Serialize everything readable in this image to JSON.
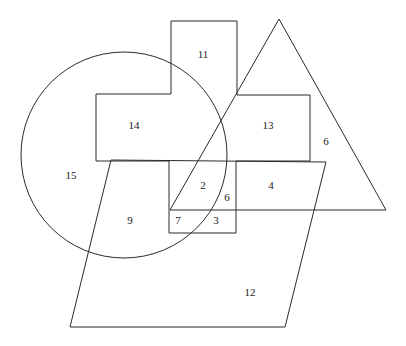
{
  "figure": {
    "canvas": {
      "width": 406,
      "height": 346,
      "background": "#ffffff"
    },
    "stroke_color": "#2b2b2b",
    "label_color": "#1a1a1a",
    "shapes": [
      {
        "name": "circle",
        "type": "circle",
        "cx": 124,
        "cy": 155,
        "r": 103
      },
      {
        "name": "cross-polygon",
        "type": "polygon",
        "points": "171,21 237,21 237,95 310,95 310,161 236,161 236,233 169,233 169,161 96,161 96,94 171,94"
      },
      {
        "name": "triangle",
        "type": "polygon",
        "points": "279,19 386,210 170,210"
      },
      {
        "name": "parallelogram",
        "type": "polygon",
        "points": "111,160 326,162 285,327 70,327"
      }
    ],
    "labels": [
      {
        "name": "region-label-11",
        "text": "11",
        "x": 203,
        "y": 55
      },
      {
        "name": "region-label-14",
        "text": "14",
        "x": 134,
        "y": 126
      },
      {
        "name": "region-label-13",
        "text": "13",
        "x": 268,
        "y": 126
      },
      {
        "name": "region-label-6-triangle",
        "text": "6",
        "x": 326,
        "y": 142
      },
      {
        "name": "region-label-15",
        "text": "15",
        "x": 71,
        "y": 176
      },
      {
        "name": "region-label-2",
        "text": "2",
        "x": 203,
        "y": 186
      },
      {
        "name": "region-label-6-small",
        "text": "6",
        "x": 227,
        "y": 198
      },
      {
        "name": "region-label-4",
        "text": "4",
        "x": 271,
        "y": 186
      },
      {
        "name": "region-label-9",
        "text": "9",
        "x": 130,
        "y": 221
      },
      {
        "name": "region-label-7",
        "text": "7",
        "x": 178,
        "y": 221
      },
      {
        "name": "region-label-3",
        "text": "3",
        "x": 216,
        "y": 221
      },
      {
        "name": "region-label-12",
        "text": "12",
        "x": 250,
        "y": 293
      }
    ]
  }
}
